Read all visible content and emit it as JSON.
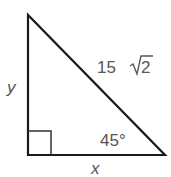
{
  "diagram": {
    "shape": "right-triangle",
    "labels": {
      "vertical_leg": "y",
      "horizontal_leg": "x",
      "hypotenuse_coef": "15",
      "hypotenuse_radicand": "2",
      "angle": "45°"
    },
    "colors": {
      "stroke": "#1a1a1a",
      "text": "#555555"
    }
  }
}
